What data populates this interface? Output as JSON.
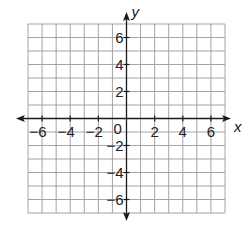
{
  "chart_data": {
    "type": "scatter",
    "title": "",
    "xlabel": "x",
    "ylabel": "y",
    "xlim": [
      -7,
      7
    ],
    "ylim": [
      -7,
      7
    ],
    "grid": true,
    "grid_step": 1,
    "x_ticks": [
      -6,
      -4,
      -2,
      2,
      4,
      6
    ],
    "y_ticks": [
      -6,
      -4,
      -2,
      2,
      4,
      6
    ],
    "x_tick_labels": [
      "−6",
      "−4",
      "−2",
      "2",
      "4",
      "6"
    ],
    "y_tick_labels": [
      "−6",
      "−4",
      "−2",
      "2",
      "4",
      "6"
    ],
    "origin_label": "0",
    "series": [],
    "axes_arrows": true,
    "legend": null
  },
  "colors": {
    "grid": "#9a9a9a",
    "axis": "#1a1a1a",
    "text": "#222222",
    "background": "#ffffff"
  },
  "layout": {
    "grid_left": 28,
    "grid_right": 225,
    "grid_top": 24,
    "grid_bottom": 213,
    "x_axis_arrow_left": 16,
    "x_axis_arrow_right": 231,
    "y_axis_arrow_top": 12,
    "y_axis_arrow_bottom": 221
  }
}
